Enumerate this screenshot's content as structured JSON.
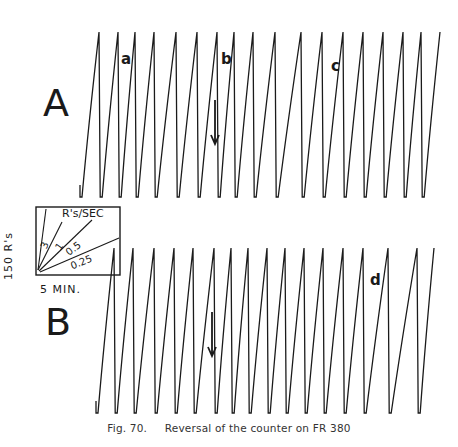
{
  "figure": {
    "caption_number": "Fig. 70.",
    "caption_text": "Reversal of the counter on FR 380",
    "panels": [
      {
        "letter": "A",
        "marks": [
          "a",
          "b",
          "c"
        ]
      },
      {
        "letter": "B",
        "marks": [
          "d"
        ]
      }
    ],
    "legend": {
      "title": "R's/SEC",
      "y_label": "150 R's",
      "x_label": "5 MIN.",
      "rates": [
        "3",
        "1",
        "0.5",
        "0.25"
      ]
    },
    "colors": {
      "ink": "#1a1a1a",
      "background": "#ffffff"
    }
  },
  "chart_data": {
    "type": "line",
    "title": "Reversal of the counter on FR 380",
    "subtitle": "Cumulative records (sawtooth); pen resets every 150 responses",
    "xlabel": "Time (scale bar: 5 MIN.)",
    "ylabel": "Cumulative responses (scale bar: 150 R's)",
    "legend": {
      "title": "R's/SEC",
      "slopes": [
        3,
        1,
        0.5,
        0.25
      ],
      "position": "left, between panels"
    },
    "grid": false,
    "series": [
      {
        "name": "A",
        "y_top": 32,
        "y_bottom": 197,
        "start_x": 80,
        "reset_x": [
          99,
          118,
          135,
          154,
          176,
          197,
          217,
          234,
          253,
          275,
          301,
          322,
          343,
          363,
          383,
          403,
          421,
          440
        ],
        "annotations": [
          {
            "label": "a",
            "x": 122,
            "y": 60
          },
          {
            "label": "b",
            "x": 220,
            "y": 60
          },
          {
            "label": "c",
            "x": 332,
            "y": 67
          },
          {
            "label": "arrow-down",
            "x": 215,
            "y1": 100,
            "y2": 144
          }
        ]
      },
      {
        "name": "B",
        "y_top": 248,
        "y_bottom": 413,
        "start_x": 96,
        "reset_x": [
          114,
          133,
          154,
          174,
          193,
          214,
          231,
          248,
          267,
          285,
          304,
          323,
          343,
          363,
          388,
          417,
          434
        ],
        "annotations": [
          {
            "label": "d",
            "x": 371,
            "y": 281
          },
          {
            "label": "arrow-down",
            "x": 212,
            "y1": 312,
            "y2": 356
          }
        ]
      }
    ]
  }
}
